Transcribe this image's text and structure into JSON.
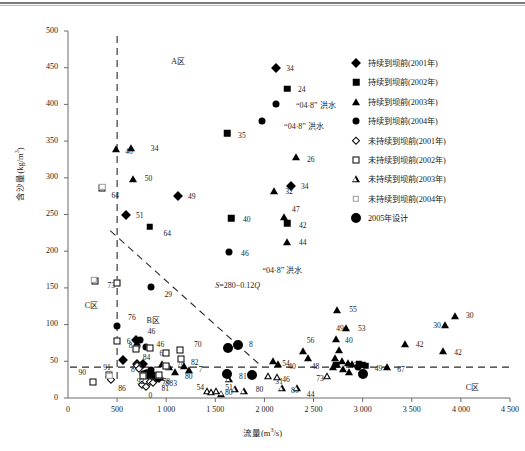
{
  "chart_data": {
    "type": "scatter",
    "title": "",
    "xlabel": "流量(m³/s)",
    "ylabel": "含沙量(kg/m³)",
    "xlim": [
      0,
      4500
    ],
    "ylim": [
      0,
      500
    ],
    "xticks": [
      "0",
      "500",
      "1 000",
      "1 500",
      "2 000",
      "2 500",
      "3 000",
      "3 500",
      "4 000",
      "4 500"
    ],
    "xtick_values": [
      0,
      500,
      1000,
      1500,
      2000,
      2500,
      3000,
      3500,
      4000,
      4500
    ],
    "yticks": [
      "0",
      "50",
      "100",
      "150",
      "200",
      "250",
      "300",
      "350",
      "400",
      "450",
      "500"
    ],
    "ytick_values": [
      0,
      50,
      100,
      150,
      200,
      250,
      300,
      350,
      400,
      450,
      500
    ],
    "grid": false,
    "legend_position": "right",
    "legend": [
      {
        "marker": "filled-diamond",
        "label": "持续到坝前(2001年)"
      },
      {
        "marker": "filled-square",
        "label": "持续到坝前(2002年)"
      },
      {
        "marker": "filled-triangle",
        "label": "持续到坝前(2003年)"
      },
      {
        "marker": "filled-circle",
        "label": "持续到坝前(2004年)"
      },
      {
        "marker": "open-diamond",
        "label": "未持续到坝前(2001年)"
      },
      {
        "marker": "open-square",
        "label": "未持续到坝前(2002年)"
      },
      {
        "marker": "open-triangle",
        "label": "未持续到坝前(2003年)"
      },
      {
        "marker": "faint-square",
        "label": "未持续到坝前(2004年)"
      },
      {
        "marker": "big-filled-circle",
        "label": "2005年设计"
      }
    ],
    "annotations": [
      {
        "text": "A区",
        "x": 1050,
        "y": 460
      },
      {
        "text": "B区",
        "x": 800,
        "y": 108
      },
      {
        "text": "C区",
        "x": 170,
        "y": 128
      },
      {
        "text": "C区",
        "x": 4050,
        "y": 17
      },
      {
        "text": "“04·8” 洪水",
        "x": 2320,
        "y": 400
      },
      {
        "text": "“04·8” 洪水",
        "x": 2200,
        "y": 372
      },
      {
        "text": "“04·8” 洪水",
        "x": 1980,
        "y": 176
      },
      {
        "text": "S=280−0.12Q",
        "x": 1500,
        "y": 152
      }
    ],
    "reference_lines": [
      {
        "type": "vertical",
        "x": 500,
        "style": "dashed",
        "note": "A/C zone split"
      },
      {
        "type": "horizontal",
        "y": 42,
        "style": "dashed",
        "note": "lower threshold"
      },
      {
        "type": "sloped",
        "equation": "S=280-0.12Q",
        "style": "dashed",
        "from": [
          430,
          228
        ],
        "to": [
          1980,
          42
        ]
      }
    ],
    "series": [
      {
        "name": "持续到坝前(2001年)",
        "marker": "filled-diamond",
        "points": [
          {
            "x": 2120,
            "y": 450,
            "label": "34",
            "lx": 8,
            "ly": 0
          },
          {
            "x": 2270,
            "y": 289,
            "label": "34",
            "lx": 8,
            "ly": 0
          },
          {
            "x": 1120,
            "y": 275,
            "label": "49",
            "lx": 8,
            "ly": 0
          },
          {
            "x": 590,
            "y": 249,
            "label": "51",
            "lx": 8,
            "ly": 0
          },
          {
            "x": 560,
            "y": 52,
            "label": "8",
            "lx": 6,
            "ly": 9
          },
          {
            "x": 700,
            "y": 47,
            "label": "84",
            "lx": 4,
            "ly": -7
          },
          {
            "x": 760,
            "y": 46,
            "label": "",
            "lx": 0,
            "ly": 0
          },
          {
            "x": 690,
            "y": 79,
            "label": "6",
            "lx": -11,
            "ly": 1
          },
          {
            "x": 800,
            "y": 33,
            "label": "",
            "lx": 0,
            "ly": 0
          },
          {
            "x": 830,
            "y": 31,
            "label": "",
            "lx": 0,
            "ly": 0
          },
          {
            "x": 880,
            "y": 29,
            "label": "78",
            "lx": 5,
            "ly": 6
          },
          {
            "x": 930,
            "y": 27,
            "label": "",
            "lx": 0,
            "ly": 0
          }
        ]
      },
      {
        "name": "持续到坝前(2002年)",
        "marker": "filled-square",
        "points": [
          {
            "x": 2230,
            "y": 421,
            "label": "24",
            "lx": 9,
            "ly": 0
          },
          {
            "x": 1620,
            "y": 361,
            "label": "35",
            "lx": 9,
            "ly": 2
          },
          {
            "x": 1660,
            "y": 245,
            "label": "40",
            "lx": 10,
            "ly": 1
          },
          {
            "x": 2230,
            "y": 238,
            "label": "42",
            "lx": 10,
            "ly": 2
          },
          {
            "x": 830,
            "y": 233,
            "label": "64",
            "lx": 12,
            "ly": 6
          },
          {
            "x": 2730,
            "y": 45,
            "label": "",
            "lx": 0,
            "ly": 0
          },
          {
            "x": 2960,
            "y": 46,
            "label": "49",
            "lx": 14,
            "ly": 4
          },
          {
            "x": 3000,
            "y": 45,
            "label": "",
            "lx": 0,
            "ly": 0
          },
          {
            "x": 3030,
            "y": 44,
            "label": "",
            "lx": 0,
            "ly": 0
          }
        ]
      },
      {
        "name": "持续到坝前(2003年)",
        "marker": "filled-triangle",
        "points": [
          {
            "x": 640,
            "y": 340,
            "label": "34",
            "lx": 18,
            "ly": 0
          },
          {
            "x": 490,
            "y": 339,
            "label": "40",
            "lx": 7,
            "ly": 2
          },
          {
            "x": 2320,
            "y": 328,
            "label": "26",
            "lx": 9,
            "ly": 2
          },
          {
            "x": 660,
            "y": 298,
            "label": "50",
            "lx": 10,
            "ly": -1
          },
          {
            "x": 2100,
            "y": 282,
            "label": "32",
            "lx": 9,
            "ly": 0
          },
          {
            "x": 2200,
            "y": 246,
            "label": "47",
            "lx": 6,
            "ly": -8
          },
          {
            "x": 2230,
            "y": 212,
            "label": "44",
            "lx": 10,
            "ly": 0
          },
          {
            "x": 2740,
            "y": 120,
            "label": "55",
            "lx": 10,
            "ly": -1
          },
          {
            "x": 3940,
            "y": 112,
            "label": "30",
            "lx": 9,
            "ly": -1
          },
          {
            "x": 3840,
            "y": 100,
            "label": "30",
            "lx": -14,
            "ly": 0
          },
          {
            "x": 2830,
            "y": 95,
            "label": "53",
            "lx": 10,
            "ly": 0
          },
          {
            "x": 2730,
            "y": 81,
            "label": "49",
            "lx": -2,
            "ly": -11
          },
          {
            "x": 3430,
            "y": 73,
            "label": "42",
            "lx": 9,
            "ly": 0
          },
          {
            "x": 3820,
            "y": 64,
            "label": "42",
            "lx": 9,
            "ly": 1
          },
          {
            "x": 2390,
            "y": 64,
            "label": "56",
            "lx": 2,
            "ly": -11
          },
          {
            "x": 2760,
            "y": 66,
            "label": "40",
            "lx": 4,
            "ly": -10
          },
          {
            "x": 2440,
            "y": 55,
            "label": "48",
            "lx": 2,
            "ly": 8
          },
          {
            "x": 2090,
            "y": 51,
            "label": "54",
            "lx": 7,
            "ly": 2
          },
          {
            "x": 2140,
            "y": 47,
            "label": "40",
            "lx": 8,
            "ly": 2
          },
          {
            "x": 2720,
            "y": 54,
            "label": "",
            "lx": 0,
            "ly": 0
          },
          {
            "x": 2790,
            "y": 50,
            "label": "43",
            "lx": 6,
            "ly": 4
          },
          {
            "x": 2850,
            "y": 48,
            "label": "",
            "lx": 0,
            "ly": 0
          },
          {
            "x": 2890,
            "y": 46,
            "label": "",
            "lx": 0,
            "ly": 0
          },
          {
            "x": 2700,
            "y": 42,
            "label": "",
            "lx": 0,
            "ly": 0
          },
          {
            "x": 2800,
            "y": 39,
            "label": "",
            "lx": 0,
            "ly": 0
          },
          {
            "x": 2860,
            "y": 36,
            "label": "",
            "lx": 0,
            "ly": 0
          },
          {
            "x": 3250,
            "y": 42,
            "label": "67",
            "lx": 8,
            "ly": 2
          },
          {
            "x": 960,
            "y": 46,
            "label": "",
            "lx": 0,
            "ly": 0
          },
          {
            "x": 1030,
            "y": 42,
            "label": "78",
            "lx": 6,
            "ly": -4
          },
          {
            "x": 1090,
            "y": 35,
            "label": "80",
            "lx": 8,
            "ly": 4
          },
          {
            "x": 1180,
            "y": 43,
            "label": "82",
            "lx": 5,
            "ly": -4
          },
          {
            "x": 1230,
            "y": 38,
            "label": "7",
            "lx": 8,
            "ly": -1
          },
          {
            "x": 900,
            "y": 31,
            "label": "78",
            "lx": 4,
            "ly": 6
          },
          {
            "x": 940,
            "y": 28,
            "label": "83",
            "lx": 7,
            "ly": 6
          }
        ]
      },
      {
        "name": "持续到坝前(2004年)",
        "marker": "filled-circle",
        "points": [
          {
            "x": 2120,
            "y": 400,
            "label": "",
            "lx": 0,
            "ly": 0
          },
          {
            "x": 1980,
            "y": 378,
            "label": "",
            "lx": 0,
            "ly": 0
          },
          {
            "x": 1640,
            "y": 199,
            "label": "46",
            "lx": 10,
            "ly": 1
          },
          {
            "x": 840,
            "y": 151,
            "label": "29",
            "lx": 12,
            "ly": 7
          },
          {
            "x": 500,
            "y": 98,
            "label": "76",
            "lx": 9,
            "ly": -9
          },
          {
            "x": 730,
            "y": 79,
            "label": "46",
            "lx": 6,
            "ly": -9
          },
          {
            "x": 790,
            "y": 70,
            "label": "46",
            "lx": 9,
            "ly": -3
          },
          {
            "x": 700,
            "y": 71,
            "label": "8",
            "lx": -10,
            "ly": -1
          },
          {
            "x": 840,
            "y": 38,
            "label": "",
            "lx": 0,
            "ly": 0
          },
          {
            "x": 790,
            "y": 34,
            "label": "",
            "lx": 0,
            "ly": 0
          },
          {
            "x": 810,
            "y": 30,
            "label": "",
            "lx": 0,
            "ly": 0
          },
          {
            "x": 760,
            "y": 33,
            "label": "",
            "lx": 0,
            "ly": 0
          },
          {
            "x": 870,
            "y": 32,
            "label": "",
            "lx": 0,
            "ly": 0
          },
          {
            "x": 900,
            "y": 26,
            "label": "",
            "lx": 0,
            "ly": 0
          },
          {
            "x": 2950,
            "y": 42,
            "label": "",
            "lx": 0,
            "ly": 0
          }
        ]
      },
      {
        "name": "未持续到坝前(2001年)",
        "marker": "open-diamond",
        "points": [
          {
            "x": 420,
            "y": 28,
            "label": "",
            "lx": 0,
            "ly": 0
          },
          {
            "x": 440,
            "y": 25,
            "label": "86",
            "lx": 5,
            "ly": 8
          },
          {
            "x": 700,
            "y": 44,
            "label": "",
            "lx": 0,
            "ly": 0
          },
          {
            "x": 720,
            "y": 40,
            "label": "",
            "lx": 0,
            "ly": 0
          },
          {
            "x": 750,
            "y": 18,
            "label": "",
            "lx": 0,
            "ly": 0
          },
          {
            "x": 790,
            "y": 15,
            "label": "0",
            "lx": 1,
            "ly": 8
          },
          {
            "x": 830,
            "y": 22,
            "label": "",
            "lx": 0,
            "ly": 0
          },
          {
            "x": 870,
            "y": 20,
            "label": "81",
            "lx": 6,
            "ly": 5
          }
        ]
      },
      {
        "name": "未持续到坝前(2002年)",
        "marker": "open-square",
        "points": [
          {
            "x": 350,
            "y": 286,
            "label": "64",
            "lx": 7,
            "ly": 7
          },
          {
            "x": 270,
            "y": 160,
            "label": "73",
            "lx": 11,
            "ly": 4
          },
          {
            "x": 500,
            "y": 157,
            "label": "",
            "lx": 0,
            "ly": 0
          },
          {
            "x": 500,
            "y": 77,
            "label": "",
            "lx": 0,
            "ly": 0
          },
          {
            "x": 690,
            "y": 67,
            "label": "",
            "lx": 0,
            "ly": 0
          },
          {
            "x": 830,
            "y": 68,
            "label": "64",
            "lx": 8,
            "ly": 5
          },
          {
            "x": 1000,
            "y": 61,
            "label": "",
            "lx": 0,
            "ly": 0
          },
          {
            "x": 1140,
            "y": 65,
            "label": "70",
            "lx": 12,
            "ly": -6
          },
          {
            "x": 1150,
            "y": 53,
            "label": "",
            "lx": 0,
            "ly": 0
          },
          {
            "x": 1000,
            "y": 43,
            "label": "",
            "lx": 0,
            "ly": 0
          },
          {
            "x": 250,
            "y": 22,
            "label": "90",
            "lx": -16,
            "ly": -10
          },
          {
            "x": 420,
            "y": 32,
            "label": "91",
            "lx": -8,
            "ly": -8
          },
          {
            "x": 760,
            "y": 30,
            "label": "92",
            "lx": -8,
            "ly": 5
          },
          {
            "x": 930,
            "y": 32,
            "label": "",
            "lx": 0,
            "ly": 0
          }
        ]
      },
      {
        "name": "未持续到坝前(2003年)",
        "marker": "open-triangle",
        "points": [
          {
            "x": 1420,
            "y": 9,
            "label": "54",
            "lx": -13,
            "ly": -4
          },
          {
            "x": 1460,
            "y": 8,
            "label": "",
            "lx": 0,
            "ly": 0
          },
          {
            "x": 1510,
            "y": 9,
            "label": "51",
            "lx": 7,
            "ly": -4
          },
          {
            "x": 1560,
            "y": 6,
            "label": "",
            "lx": 0,
            "ly": 0
          },
          {
            "x": 1640,
            "y": 26,
            "label": "81",
            "lx": 8,
            "ly": -3
          },
          {
            "x": 1700,
            "y": 12,
            "label": "80",
            "lx": -12,
            "ly": 3
          },
          {
            "x": 1790,
            "y": 9,
            "label": "80",
            "lx": 10,
            "ly": -2
          },
          {
            "x": 2040,
            "y": 30,
            "label": "31",
            "lx": 5,
            "ly": 5
          },
          {
            "x": 2130,
            "y": 28,
            "label": "46",
            "lx": 3,
            "ly": 2
          },
          {
            "x": 2180,
            "y": 14,
            "label": "80",
            "lx": 7,
            "ly": 2
          },
          {
            "x": 2640,
            "y": 30,
            "label": "73",
            "lx": -13,
            "ly": 2
          },
          {
            "x": 2330,
            "y": 14,
            "label": "44",
            "lx": 8,
            "ly": 6
          }
        ]
      },
      {
        "name": "未持续到坝前(2004年)",
        "marker": "faint-square",
        "points": [
          {
            "x": 350,
            "y": 288,
            "label": "",
            "lx": 0,
            "ly": 0
          },
          {
            "x": 262,
            "y": 161,
            "label": "",
            "lx": 0,
            "ly": 0
          },
          {
            "x": 420,
            "y": 30,
            "label": "",
            "lx": 0,
            "ly": 0
          }
        ]
      },
      {
        "name": "2005年设计",
        "marker": "big-filled-circle",
        "points": [
          {
            "x": 1630,
            "y": 68,
            "label": "",
            "lx": 0,
            "ly": 0
          },
          {
            "x": 1620,
            "y": 33,
            "label": "",
            "lx": 0,
            "ly": 0
          },
          {
            "x": 1870,
            "y": 32,
            "label": "",
            "lx": 0,
            "ly": 0
          },
          {
            "x": 3000,
            "y": 33,
            "label": "",
            "lx": 0,
            "ly": 0
          },
          {
            "x": 1730,
            "y": 72,
            "label": "8",
            "lx": 9,
            "ly": -1
          }
        ]
      }
    ]
  }
}
